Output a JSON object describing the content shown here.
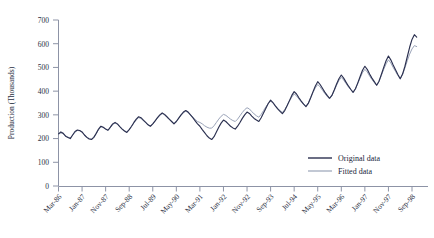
{
  "chart_data": {
    "type": "line",
    "title": "",
    "xlabel": "",
    "ylabel": "Production (Thousands)",
    "ylim": [
      0,
      700
    ],
    "yticks": [
      0,
      100,
      200,
      300,
      400,
      500,
      600,
      700
    ],
    "grid": false,
    "legend_position": "bottom-right",
    "xtick_labels": [
      "Mar-86",
      "Jan-87",
      "Nov-87",
      "Sep-88",
      "Jul-89",
      "May-90",
      "Mar-91",
      "Jan-92",
      "Nov-92",
      "Sep-93",
      "Jul-94",
      "May-95",
      "Mar-96",
      "Jan-97",
      "Nov-97",
      "Sep-98"
    ],
    "xtick_indices": [
      0,
      10,
      20,
      30,
      40,
      50,
      60,
      70,
      80,
      90,
      100,
      110,
      120,
      130,
      140,
      150
    ],
    "x_start": "Mar-86",
    "x_end": "Sep-98",
    "x_count": 151,
    "series": [
      {
        "name": "Original data",
        "color": "#2b3050",
        "values": [
          220,
          228,
          222,
          210,
          205,
          200,
          215,
          230,
          236,
          234,
          228,
          215,
          205,
          198,
          196,
          205,
          222,
          240,
          252,
          248,
          240,
          235,
          248,
          262,
          268,
          262,
          250,
          240,
          232,
          226,
          238,
          252,
          268,
          282,
          292,
          288,
          278,
          268,
          258,
          252,
          262,
          275,
          288,
          300,
          308,
          302,
          292,
          282,
          272,
          262,
          272,
          286,
          300,
          312,
          318,
          312,
          300,
          288,
          275,
          262,
          252,
          238,
          225,
          212,
          202,
          196,
          208,
          228,
          248,
          265,
          278,
          272,
          262,
          252,
          245,
          240,
          252,
          268,
          285,
          300,
          312,
          306,
          295,
          285,
          278,
          272,
          288,
          308,
          328,
          348,
          362,
          352,
          338,
          325,
          315,
          305,
          318,
          338,
          360,
          382,
          398,
          388,
          372,
          358,
          345,
          335,
          348,
          372,
          398,
          422,
          440,
          428,
          412,
          396,
          382,
          370,
          382,
          405,
          430,
          452,
          468,
          455,
          438,
          422,
          408,
          395,
          410,
          435,
          462,
          488,
          505,
          492,
          472,
          455,
          440,
          425,
          442,
          470,
          500,
          528,
          548,
          532,
          510,
          490,
          470,
          452,
          472,
          505,
          545,
          585,
          618,
          638,
          628
        ]
      },
      {
        "name": "Fitted data",
        "color": "#9aa3b8",
        "values": [
          218,
          224,
          220,
          212,
          206,
          203,
          214,
          227,
          234,
          233,
          227,
          216,
          207,
          200,
          198,
          206,
          221,
          237,
          249,
          247,
          240,
          234,
          246,
          259,
          265,
          260,
          250,
          241,
          233,
          228,
          238,
          251,
          266,
          279,
          288,
          285,
          276,
          267,
          258,
          252,
          261,
          274,
          286,
          298,
          305,
          300,
          290,
          281,
          272,
          264,
          272,
          285,
          298,
          309,
          315,
          310,
          300,
          290,
          280,
          272,
          268,
          262,
          254,
          248,
          244,
          244,
          254,
          268,
          282,
          294,
          302,
          298,
          290,
          282,
          276,
          272,
          282,
          296,
          310,
          322,
          330,
          325,
          314,
          304,
          296,
          290,
          302,
          318,
          334,
          348,
          358,
          350,
          338,
          327,
          318,
          310,
          322,
          340,
          358,
          375,
          388,
          380,
          367,
          355,
          345,
          337,
          350,
          372,
          394,
          414,
          428,
          418,
          404,
          390,
          378,
          368,
          380,
          402,
          425,
          445,
          458,
          447,
          432,
          418,
          406,
          395,
          409,
          432,
          456,
          478,
          492,
          481,
          464,
          449,
          436,
          424,
          440,
          466,
          492,
          515,
          532,
          519,
          500,
          483,
          466,
          452,
          470,
          498,
          528,
          556,
          578,
          592,
          588
        ]
      }
    ]
  },
  "legend": {
    "items": [
      {
        "label": "Original data",
        "color": "#2b3050"
      },
      {
        "label": "Fitted data",
        "color": "#9aa3b8"
      }
    ]
  },
  "axis": {
    "y_title": "Production (Thousands)"
  }
}
